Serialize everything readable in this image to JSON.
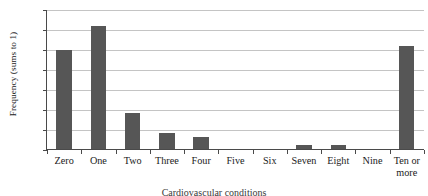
{
  "chart_data": {
    "type": "bar",
    "title": "",
    "subtitle": "",
    "xlabel": "",
    "ylabel": "Frequency (sums to 1)",
    "categories": [
      "Zero",
      "One",
      "Two",
      "Three",
      "Four",
      "Five",
      "Six",
      "Seven",
      "Eight",
      "Nine",
      "Ten or\nmore"
    ],
    "values": [
      0.25,
      0.31,
      0.09,
      0.04,
      0.03,
      0.0,
      0.0,
      0.01,
      0.01,
      0.0,
      0.26
    ],
    "ylim": [
      0,
      0.35
    ],
    "ytick_values": [
      0.35,
      0.3,
      0.25,
      0.2,
      0.15,
      0.1,
      0.05,
      0
    ],
    "ytick_labels": [
      ".35",
      ".30",
      ".25",
      ".20",
      ".15",
      ".10",
      ".5",
      "0"
    ],
    "grid": true,
    "legend": false,
    "legend_position": "none",
    "bar_color": "#565656",
    "grid_color": "#c4c4c4",
    "axis_color": "#4a4a4a",
    "text_color": "#1a1a1a"
  },
  "caption": {
    "text": "Cardiovascular conditions"
  }
}
